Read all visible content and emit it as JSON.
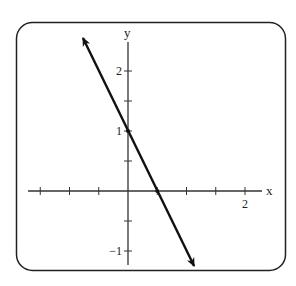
{
  "chart_data": {
    "type": "line",
    "title": "",
    "xlabel": "x",
    "ylabel": "y",
    "xlim": [
      -1.5,
      2.25
    ],
    "ylim": [
      -1.25,
      2.5
    ],
    "grid": false,
    "legend": null,
    "x_ticks": [
      -1.5,
      -1,
      -0.5,
      0.5,
      1,
      1.5,
      2
    ],
    "x_tick_labels": [
      {
        "value": 2,
        "label": "2"
      }
    ],
    "y_ticks": [
      2,
      1.5,
      1,
      0.5,
      -0.5,
      -1
    ],
    "y_tick_labels": [
      {
        "value": 2,
        "label": "2"
      },
      {
        "value": 1,
        "label": "1"
      },
      {
        "value": -1,
        "label": "−1"
      }
    ],
    "series": [
      {
        "name": "y = -2x + 1",
        "equation": "y = -2x + 1",
        "slope": -2,
        "intercept": 1,
        "x": [
          -0.77,
          1.13
        ],
        "y": [
          2.55,
          -1.25
        ],
        "arrows": "both",
        "marked_points": [
          {
            "x": 0,
            "y": 1
          },
          {
            "x": 0.5,
            "y": 0
          }
        ]
      }
    ]
  },
  "colors": {
    "line": "#111111",
    "axis": "#333333",
    "frame": "#222222",
    "background": "#ffffff"
  }
}
